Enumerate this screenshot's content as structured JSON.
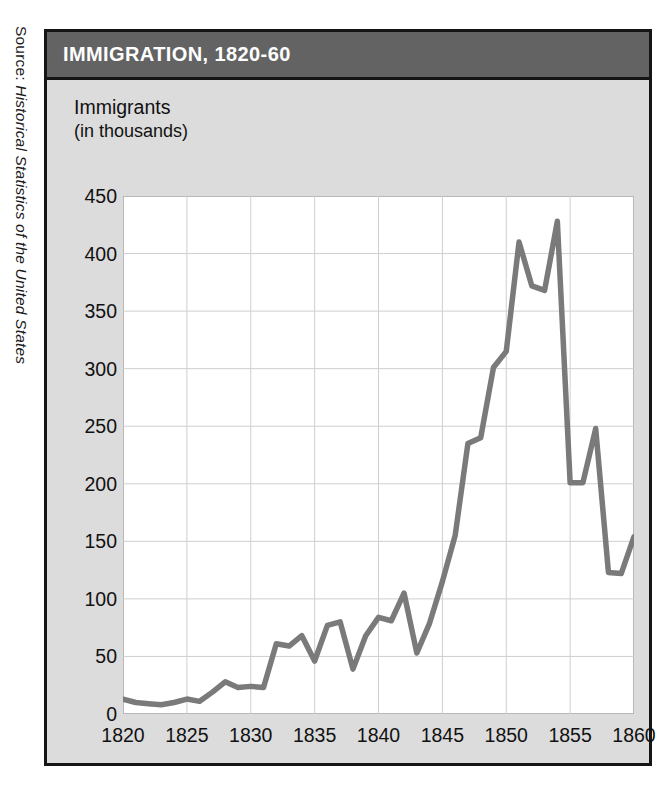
{
  "source": {
    "prefix": "Source: ",
    "title": "Historical Statistics of the United States"
  },
  "header": {
    "title": "IMMIGRATION, 1820-60"
  },
  "axis_block_label": {
    "line1": "Immigrants",
    "line2": "(in thousands)"
  },
  "colors": {
    "header_band": "#636363",
    "figure_background": "#dcdcdc",
    "plot_background": "#ffffff",
    "frame": "#151515",
    "gridline": "#cfcfcf",
    "line": "#7a7a7a",
    "title_text": "#ffffff",
    "tick_text": "#111111"
  },
  "chart_data": {
    "type": "line",
    "title": "IMMIGRATION, 1820-60",
    "xlabel": "",
    "ylabel": "Immigrants (in thousands)",
    "xlim": [
      1820,
      1860
    ],
    "ylim": [
      0,
      450
    ],
    "grid": true,
    "legend": "none",
    "yticks": [
      450,
      400,
      350,
      300,
      250,
      200,
      150,
      100,
      50,
      0
    ],
    "xticks": [
      1820,
      1825,
      1830,
      1835,
      1840,
      1845,
      1850,
      1855,
      1860
    ],
    "series": [
      {
        "name": "Immigrants",
        "color": "#7a7a7a",
        "x": [
          1820,
          1821,
          1822,
          1823,
          1824,
          1825,
          1826,
          1827,
          1828,
          1829,
          1830,
          1831,
          1832,
          1833,
          1834,
          1835,
          1836,
          1837,
          1838,
          1839,
          1840,
          1841,
          1842,
          1843,
          1844,
          1845,
          1846,
          1847,
          1848,
          1849,
          1850,
          1851,
          1852,
          1853,
          1854,
          1855,
          1856,
          1857,
          1858,
          1859,
          1860
        ],
        "values": [
          13,
          10,
          9,
          8,
          10,
          13,
          11,
          19,
          28,
          23,
          24,
          23,
          61,
          59,
          68,
          46,
          77,
          80,
          39,
          68,
          84,
          81,
          105,
          53,
          79,
          115,
          155,
          235,
          240,
          301,
          315,
          410,
          372,
          368,
          428,
          201,
          201,
          248,
          123,
          122,
          154
        ],
        "notes": "Values read from the plotted curve; the peak occurs in 1853-54 at roughly 445 thousand, with a sharp trough near 1855 at roughly 200 thousand."
      }
    ]
  }
}
